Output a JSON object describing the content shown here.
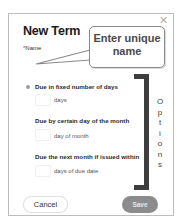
{
  "dialog": {
    "title": "New Term",
    "close_icon": "close-icon",
    "name_field": {
      "required_marker": "*",
      "label": "Name",
      "value": "",
      "placeholder": ""
    },
    "options": [
      {
        "label": "Due in fixed number of days",
        "selected": true,
        "input_value": "",
        "unit": "days"
      },
      {
        "label": "Due by certain day of the month",
        "selected": false,
        "input_value": "",
        "unit": "day of month"
      },
      {
        "label": "Due the next month if issued within",
        "selected": false,
        "input_value": "",
        "unit": "days of due date"
      }
    ],
    "buttons": {
      "cancel": "Cancel",
      "save": "Save"
    }
  },
  "annotations": {
    "callout_text_line1": "Enter unique",
    "callout_text_line2": "name",
    "bracket_label": "O p t i o n s",
    "bracket_letters": [
      "O",
      "p",
      "t",
      "i",
      "o",
      "n",
      "s"
    ],
    "bracket_color": "#3d3d3d"
  },
  "colors": {
    "save_button_bg": "#8c8c8c",
    "border": "#bdbdbd"
  }
}
